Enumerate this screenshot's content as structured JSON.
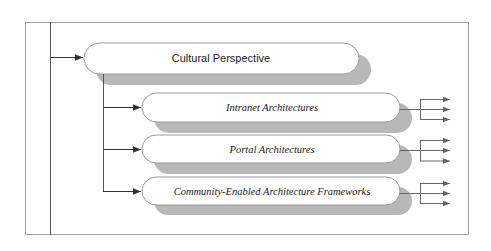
{
  "diagram": {
    "type": "hierarchy-flow",
    "colors": {
      "frame": "#9a9a9a",
      "line": "#444444",
      "shadow": "#b8b8b8",
      "node_fill": "#ffffff",
      "node_stroke": "#999999"
    },
    "root": {
      "label": "Cultural Perspective"
    },
    "children": [
      {
        "label": "Intranet Architectures",
        "outputs": 3
      },
      {
        "label": "Portal Architectures",
        "outputs": 3
      },
      {
        "label": "Community-Enabled Architecture Frameworks",
        "outputs": 3
      }
    ]
  }
}
